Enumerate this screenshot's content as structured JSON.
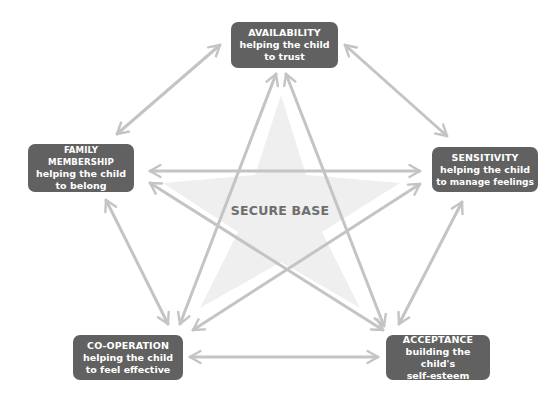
{
  "diagram": {
    "center_label": "SECURE BASE",
    "colors": {
      "node_fill": "#616161",
      "node_text": "#ffffff",
      "arrow": "#c4c4c4",
      "star_fill": "#efefef",
      "center_text": "#6e6e6e"
    },
    "nodes": [
      {
        "id": "availability",
        "title": "AVAILABILITY",
        "line1": "helping the child",
        "line2": "to trust"
      },
      {
        "id": "family-membership",
        "title": "FAMILY MEMBERSHIP",
        "line1": "helping the child",
        "line2": "to belong"
      },
      {
        "id": "sensitivity",
        "title": "SENSITIVITY",
        "line1": "helping the child",
        "line2": "to manage feelings"
      },
      {
        "id": "co-operation",
        "title": "CO-OPERATION",
        "line1": "helping the child",
        "line2": "to feel effective"
      },
      {
        "id": "acceptance",
        "title": "ACCEPTANCE",
        "line1": "building the child's",
        "line2": "self-esteem"
      }
    ],
    "connections": [
      [
        "availability",
        "family-membership"
      ],
      [
        "availability",
        "sensitivity"
      ],
      [
        "availability",
        "co-operation"
      ],
      [
        "availability",
        "acceptance"
      ],
      [
        "family-membership",
        "sensitivity"
      ],
      [
        "family-membership",
        "co-operation"
      ],
      [
        "family-membership",
        "acceptance"
      ],
      [
        "sensitivity",
        "co-operation"
      ],
      [
        "sensitivity",
        "acceptance"
      ],
      [
        "co-operation",
        "acceptance"
      ]
    ]
  }
}
